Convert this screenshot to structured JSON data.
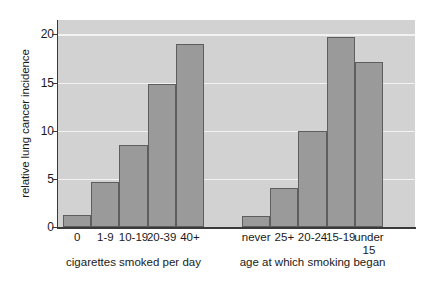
{
  "chart_data": {
    "type": "bar",
    "title": "",
    "xlabel": "",
    "ylabel": "relative lung cancer incidence",
    "ylim": [
      0,
      21.5
    ],
    "yticks": [
      0,
      5,
      10,
      15,
      20
    ],
    "ytick_labels": [
      "0",
      "5",
      "10",
      "15",
      "20"
    ],
    "grid": true,
    "legend": false,
    "groups": [
      {
        "name": "cigarettes smoked per day",
        "axis_title": "cigarettes smoked per day",
        "categories": [
          "0",
          "1-9",
          "10-19",
          "20-39",
          "40+"
        ],
        "values": [
          1.2,
          4.7,
          8.5,
          14.9,
          19.0
        ]
      },
      {
        "name": "age at which smoking began",
        "axis_title": "age at which smoking began",
        "categories": [
          "never",
          "25+",
          "20-24",
          "15-19",
          "under\n15"
        ],
        "values": [
          1.1,
          4.1,
          10.0,
          19.7,
          17.1
        ]
      }
    ]
  },
  "style": {
    "plot_background": "#d2d2d2",
    "bar_fill": "#9a9a9a",
    "bar_stroke": "#5e5e5e",
    "gridline_color": "#f2f2f2",
    "axis_color": "#3a3a3a",
    "text_color": "#1a1a1a"
  }
}
